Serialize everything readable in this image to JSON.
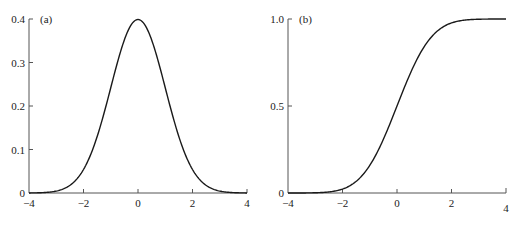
{
  "chart_data": [
    {
      "type": "line",
      "panel_label": "(a)",
      "title": "",
      "xlabel": "",
      "ylabel": "",
      "xlim": [
        -4,
        4
      ],
      "ylim": [
        0,
        0.4
      ],
      "x_ticks": [
        "-4",
        "-2",
        "0",
        "2",
        "4"
      ],
      "y_ticks": [
        "0",
        "0.1",
        "0.2",
        "0.3",
        "0.4"
      ],
      "grid": false,
      "series": [
        {
          "name": "standard normal PDF",
          "x": [
            -4,
            -3.5,
            -3,
            -2.5,
            -2,
            -1.5,
            -1,
            -0.5,
            0,
            0.5,
            1,
            1.5,
            2,
            2.5,
            3,
            3.5,
            4
          ],
          "y": [
            0.0001,
            0.0009,
            0.0044,
            0.0175,
            0.054,
            0.1295,
            0.242,
            0.3521,
            0.3989,
            0.3521,
            0.242,
            0.1295,
            0.054,
            0.0175,
            0.0044,
            0.0009,
            0.0001
          ]
        }
      ]
    },
    {
      "type": "line",
      "panel_label": "(b)",
      "title": "",
      "xlabel": "",
      "ylabel": "",
      "xlim": [
        -4,
        4
      ],
      "ylim": [
        0,
        1.0
      ],
      "x_ticks": [
        "-4",
        "-2",
        "0",
        "2",
        "4"
      ],
      "y_ticks": [
        "0",
        "0.5",
        "1.0"
      ],
      "grid": false,
      "series": [
        {
          "name": "standard normal CDF",
          "x": [
            -4,
            -3.5,
            -3,
            -2.5,
            -2,
            -1.5,
            -1,
            -0.5,
            0,
            0.5,
            1,
            1.5,
            2,
            2.5,
            3,
            3.5,
            4
          ],
          "y": [
            0.0,
            0.0002,
            0.0013,
            0.0062,
            0.0228,
            0.0668,
            0.1587,
            0.3085,
            0.5,
            0.6915,
            0.8413,
            0.9332,
            0.9772,
            0.9938,
            0.9987,
            0.9998,
            1.0
          ]
        }
      ]
    }
  ],
  "panels": {
    "a": {
      "label": "(a)",
      "y_ticks": [
        "0.4",
        "0.3",
        "0.2",
        "0.1",
        "0"
      ],
      "x_ticks": [
        "−4",
        "−2",
        "0",
        "2",
        "4"
      ]
    },
    "b": {
      "label": "(b)",
      "y_ticks": [
        "1.0",
        "0.5",
        "0"
      ],
      "x_ticks": [
        "−4",
        "−2",
        "0",
        "2",
        "4"
      ]
    }
  },
  "colors": {
    "axis": "#555555",
    "curve": "#1a1a1a",
    "text": "#222222"
  }
}
